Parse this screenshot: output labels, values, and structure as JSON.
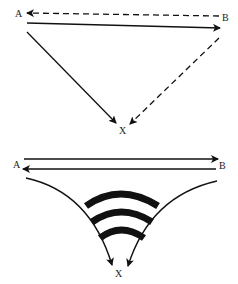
{
  "diagram_top": {
    "labels": {
      "a": "A",
      "b": "B",
      "x": "X"
    },
    "edges": [
      {
        "from": "B",
        "to": "A",
        "style": "dashed"
      },
      {
        "from": "A",
        "to": "B",
        "style": "solid"
      },
      {
        "from": "A",
        "to": "X",
        "style": "solid"
      },
      {
        "from": "B",
        "to": "X",
        "style": "dashed"
      }
    ]
  },
  "diagram_bottom": {
    "labels": {
      "a": "A",
      "b": "B",
      "x": "X"
    },
    "edges": [
      {
        "from": "A",
        "to": "B",
        "style": "solid"
      },
      {
        "from": "B",
        "to": "A",
        "style": "solid"
      },
      {
        "from": "A",
        "to": "X",
        "style": "solid-curved"
      },
      {
        "from": "B",
        "to": "X",
        "style": "solid-curved"
      }
    ],
    "bands": 3,
    "colors": {
      "ink": "#111111",
      "background": "#ffffff"
    }
  }
}
